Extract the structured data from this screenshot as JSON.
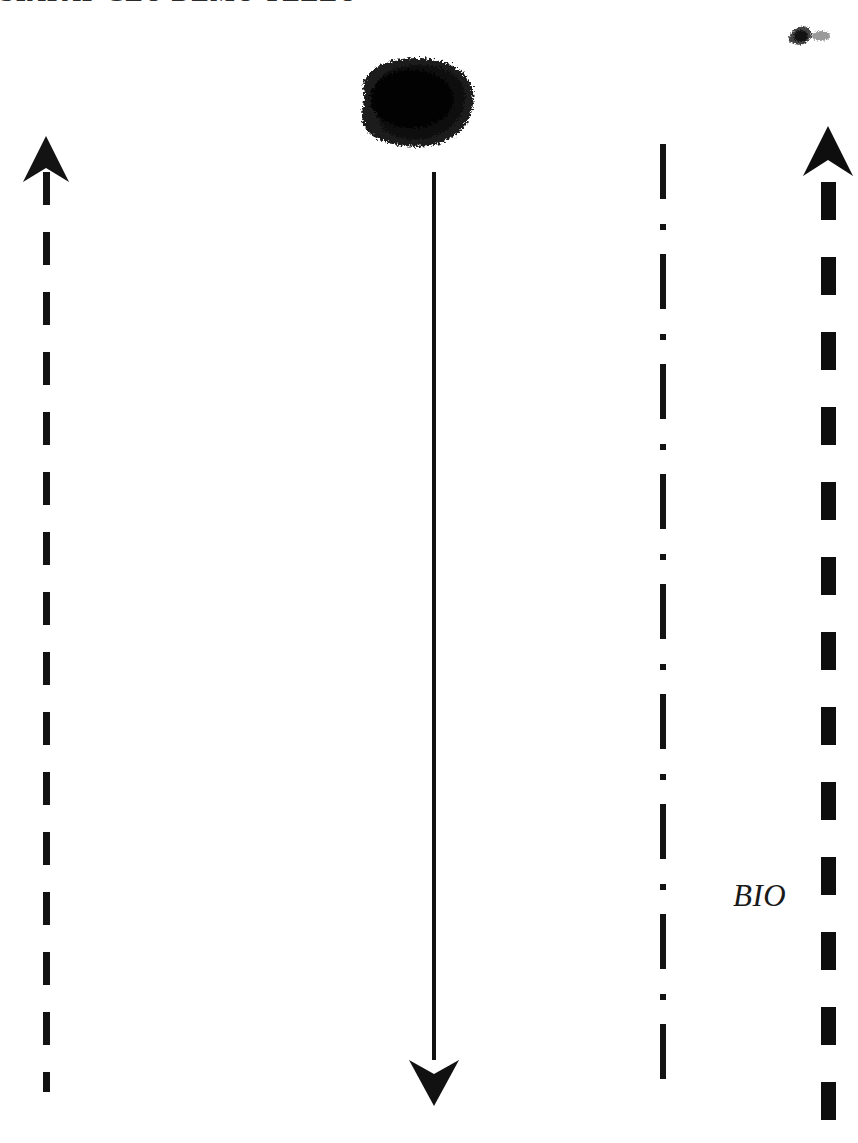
{
  "document": {
    "title_text": "SIAPAP CLU DEMU YELLU",
    "background_color": "#ffffff",
    "ink_color": "#131313"
  },
  "annotations": {
    "bio_label": "BIO"
  },
  "diagram": {
    "left_arrow": {
      "name": "left-dashed-up-arrow",
      "direction": "up",
      "style": "dashed",
      "color": "#131313"
    },
    "center_arrow": {
      "name": "center-solid-down-arrow",
      "direction": "down",
      "style": "solid",
      "color": "#111111"
    },
    "dashdot_line": {
      "name": "dash-dot-vertical-line",
      "direction": "none",
      "style": "dash-dot",
      "color": "#131313"
    },
    "right_arrow": {
      "name": "right-thick-dashed-up-arrow",
      "direction": "up",
      "style": "thick-dashed",
      "color": "#0e0e0e"
    }
  },
  "artifacts": {
    "blob_label": "ink-blob",
    "smudge_label": "ink-smudge"
  }
}
